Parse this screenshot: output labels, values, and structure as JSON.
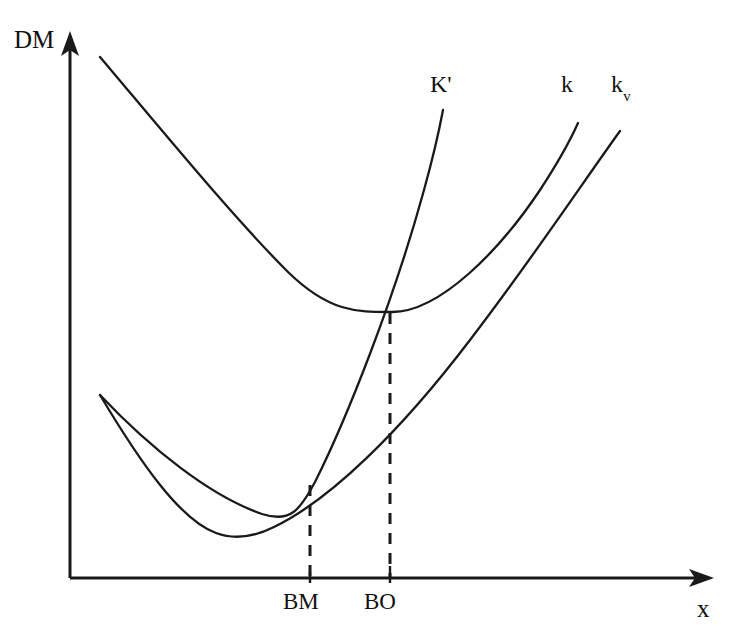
{
  "figure": {
    "background_color": "#ffffff",
    "ink_color": "#1a1a1a",
    "width": 734,
    "height": 639
  },
  "axes": {
    "y_label": "DM",
    "x_label": "x",
    "y_axis_arrow_icon": "up-arrow-icon",
    "x_axis_arrow_icon": "right-arrow-icon"
  },
  "ticks": {
    "items": [
      {
        "label": "BM",
        "x_px": 310
      },
      {
        "label": "BO",
        "x_px": 390
      }
    ]
  },
  "curve_labels": {
    "k_prime": "K'",
    "k": "k",
    "k_v_base": "k",
    "k_v_sub": "v"
  },
  "chart_data": {
    "type": "line",
    "title": "",
    "xlabel": "x",
    "ylabel": "DM",
    "grid": false,
    "legend": "inline-curve-labels",
    "axis_origin_px": [
      70,
      578
    ],
    "axis_x_end_px": 712,
    "axis_y_top_px": 33,
    "note": "Pixel coordinates are screen-space: y increases downward. Higher DM = smaller y_px.",
    "annotations": [
      {
        "name": "BM",
        "description": "Intersection of K' with the k_v curve; vertical dashed drop line to x-axis",
        "point_px": [
          310,
          485
        ],
        "dashed_from_px": [
          310,
          485
        ],
        "dashed_to_px": [
          310,
          578
        ]
      },
      {
        "name": "BO",
        "description": "Intersection of K' with the k curve; vertical dashed drop line to x-axis",
        "point_px": [
          390,
          313
        ],
        "dashed_from_px": [
          390,
          313
        ],
        "dashed_to_px": [
          390,
          578
        ]
      }
    ],
    "series": [
      {
        "name": "k",
        "label": "k",
        "shape": "convex-u-curve",
        "label_px": [
          566,
          95
        ],
        "minimum_px": [
          383,
          312
        ],
        "start_px": [
          100,
          57
        ],
        "end_px": [
          578,
          123
        ],
        "path": "M 100 57 C 160 128, 232 216, 288 272 C 330 313, 358 312, 392 312 C 440 312, 500 250, 540 190 C 557 164, 570 141, 578 123",
        "points_px": [
          [
            100,
            57
          ],
          [
            140,
            110
          ],
          [
            180,
            160
          ],
          [
            220,
            206
          ],
          [
            260,
            248
          ],
          [
            300,
            285
          ],
          [
            340,
            305
          ],
          [
            383,
            312
          ],
          [
            420,
            303
          ],
          [
            460,
            280
          ],
          [
            500,
            240
          ],
          [
            540,
            190
          ],
          [
            578,
            123
          ]
        ]
      },
      {
        "name": "k_v",
        "label": "k_v",
        "shape": "convex-u-curve",
        "label_px": [
          618,
          95
        ],
        "minimum_px": [
          238,
          536
        ],
        "start_px": [
          100,
          395
        ],
        "end_px": [
          620,
          131
        ],
        "path": "M 100 395 C 140 462, 180 520, 216 533 C 232 539, 252 538, 274 527 C 330 500, 400 432, 470 340 C 530 262, 586 178, 620 131",
        "points_px": [
          [
            100,
            395
          ],
          [
            130,
            452
          ],
          [
            160,
            492
          ],
          [
            200,
            524
          ],
          [
            238,
            536
          ],
          [
            280,
            522
          ],
          [
            320,
            498
          ],
          [
            360,
            470
          ],
          [
            400,
            430
          ],
          [
            440,
            380
          ],
          [
            480,
            328
          ],
          [
            530,
            260
          ],
          [
            570,
            200
          ],
          [
            620,
            131
          ]
        ]
      },
      {
        "name": "K_prime",
        "label": "K'",
        "shape": "rising-curve",
        "label_px": [
          440,
          95
        ],
        "start_px": [
          100,
          395
        ],
        "end_px": [
          443,
          110
        ],
        "path": "M 100 395 C 150 448, 210 496, 262 514 C 290 523, 300 511, 316 480 C 346 420, 394 300, 424 190 C 434 154, 440 126, 443 110",
        "points_px": [
          [
            100,
            395
          ],
          [
            140,
            440
          ],
          [
            180,
            478
          ],
          [
            220,
            502
          ],
          [
            262,
            514
          ],
          [
            290,
            500
          ],
          [
            310,
            485
          ],
          [
            340,
            430
          ],
          [
            370,
            365
          ],
          [
            390,
            313
          ],
          [
            410,
            250
          ],
          [
            430,
            170
          ],
          [
            443,
            110
          ]
        ]
      }
    ]
  }
}
